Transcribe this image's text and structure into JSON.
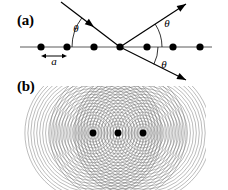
{
  "figure": {
    "width": 228,
    "height": 190,
    "background": "#ffffff",
    "ink_color": "#000000",
    "wave_color": "#808080"
  },
  "panel_a": {
    "label": "(a)",
    "description": "Bragg-like scattering from a one-dimensional chain of atoms: incident ray strikes a lattice of equally spaced points, producing reflected and transmitted rays at equal angles theta.",
    "lattice_line": {
      "x1": 20,
      "y1": 47,
      "x2": 212,
      "y2": 47
    },
    "atom_count": 7,
    "atom_radius": 3.6,
    "atoms": [
      {
        "cx": 41,
        "cy": 47
      },
      {
        "cx": 67,
        "cy": 47
      },
      {
        "cx": 94,
        "cy": 47
      },
      {
        "cx": 120,
        "cy": 47
      },
      {
        "cx": 147,
        "cy": 47
      },
      {
        "cx": 173,
        "cy": 47
      },
      {
        "cx": 200,
        "cy": 47
      }
    ],
    "spacing_label": "a",
    "spacing_label_x": 54,
    "spacing_label_y": 65,
    "spacing_arrow": {
      "x1": 41,
      "x2": 67,
      "y": 56
    },
    "incident_ray": {
      "x1": 61,
      "y1": 2,
      "x2": 120,
      "y2": 47
    },
    "incident_arrow_at": {
      "x": 94,
      "y": 27,
      "angle_deg": 37
    },
    "reflected_ray_up": {
      "x1": 120,
      "y1": 47,
      "x2": 186,
      "y2": 4
    },
    "reflected_arrow_up": {
      "x": 186,
      "y": 4,
      "angle_deg": -33
    },
    "reflected_ray_down": {
      "x1": 120,
      "y1": 47,
      "x2": 186,
      "y2": 80
    },
    "reflected_arrow_down": {
      "x": 186,
      "y": 80,
      "angle_deg": 27
    },
    "angle_labels": [
      {
        "text": "θ",
        "x": 76,
        "y": 32
      },
      {
        "text": "θ",
        "x": 167,
        "y": 27
      },
      {
        "text": "θ",
        "x": 164,
        "y": 68
      }
    ],
    "angle_arcs": [
      {
        "cx": 120,
        "cy": 47,
        "r": 48,
        "start_deg": 180,
        "end_deg": 217
      },
      {
        "cx": 120,
        "cy": 47,
        "r": 42,
        "start_deg": 327,
        "end_deg": 360
      },
      {
        "cx": 120,
        "cy": 47,
        "r": 38,
        "start_deg": 0,
        "end_deg": 27
      }
    ]
  },
  "panel_b": {
    "label": "(b)",
    "description": "Huygens construction: three point scatterers each radiate concentric circular wavelets whose overlap builds the interference pattern.",
    "source_count": 3,
    "source_radius": 3.4,
    "sources": [
      {
        "cx": 93,
        "cy": 133
      },
      {
        "cx": 118,
        "cy": 133
      },
      {
        "cx": 143,
        "cy": 133
      }
    ],
    "wavelets": {
      "rings_per_source": 23,
      "first_radius": 3.2,
      "radius_step": 2.95,
      "stroke_width": 0.55,
      "stroke_color": "#6e6e6e",
      "opacity": 0.85
    },
    "clip_box": {
      "x": 22,
      "y": 86,
      "width": 184,
      "height": 104
    }
  }
}
